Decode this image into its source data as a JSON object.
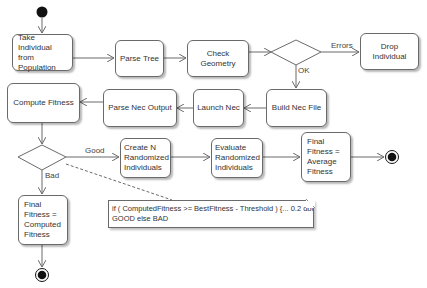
{
  "diagram": {
    "type": "UML activity diagram",
    "start_node": {
      "label": ""
    },
    "nodes": {
      "take_individual": {
        "label": "Take Individual\nfrom Population"
      },
      "parse_tree": {
        "label": "Parse Tree"
      },
      "check_geometry": {
        "label": "Check Geometry"
      },
      "drop_individual": {
        "label": "Drop Individual"
      },
      "build_nec_file": {
        "label": "Build Nec File"
      },
      "launch_nec": {
        "label": "Launch Nec"
      },
      "parse_nec_output": {
        "label": "Parse Nec Output"
      },
      "compute_fitness": {
        "label": "Compute Fitness"
      },
      "create_n_randomized": {
        "label": "Create N\nRandomized\nIndividuals"
      },
      "evaluate_randomized": {
        "label": "Evaluate\nRandomized\nIndividuals"
      },
      "final_average": {
        "label": "Final\nFitness =\nAverage\nFitness"
      },
      "final_computed": {
        "label": "Final\nFitness =\nComputed\nFitness"
      }
    },
    "decisions": {
      "geometry_check": {
        "branches": [
          "Errors",
          "OK"
        ]
      },
      "fitness_check": {
        "branches": [
          "Good",
          "Bad"
        ]
      }
    },
    "edge_labels": {
      "errors": "Errors",
      "ok": "OK",
      "good": "Good",
      "bad": "Bad"
    },
    "note": {
      "line1": "if ( ComputedFitness >= BestFitness - Threshold ) {... 0.2 dbi}",
      "line2": "GOOD else BAD"
    },
    "colors": {
      "stroke": "#6a6a6a",
      "node_fill": "#ffffff",
      "text": "#333333",
      "terminal": "#111111"
    }
  }
}
